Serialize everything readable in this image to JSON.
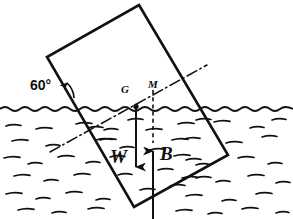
{
  "figure": {
    "labels": {
      "angle": "60°",
      "center_of_gravity": "G",
      "metacentre": "M",
      "weight_force": "W",
      "buoyancy_force": "B"
    },
    "colors": {
      "ink": "#111111",
      "paper": "#ffffff"
    },
    "geometry": {
      "block_corners": [
        [
          139,
          5
        ],
        [
          228,
          155
        ],
        [
          134,
          207
        ],
        [
          47,
          57
        ]
      ],
      "waterline_y": 108,
      "incline_degrees": 60,
      "axis_line": [
        [
          50,
          152
        ],
        [
          207,
          65
        ]
      ],
      "point_G": [
        136,
        106
      ],
      "point_M": [
        153,
        92
      ],
      "weight_arrow": [
        [
          136,
          106
        ],
        [
          136,
          176
        ]
      ],
      "buoyancy_arrow": [
        [
          153,
          219
        ],
        [
          153,
          140
        ]
      ],
      "buoyancy_dashed": [
        [
          153,
          92
        ],
        [
          153,
          140
        ]
      ]
    }
  }
}
